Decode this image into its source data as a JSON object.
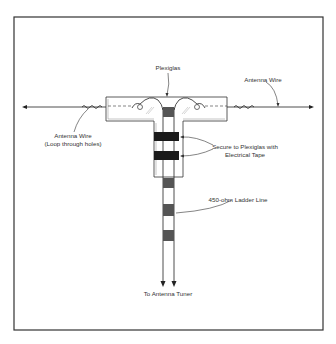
{
  "diagram": {
    "labels": {
      "plexiglas": "Plexiglas",
      "antenna_wire_right": "Antenna Wire",
      "antenna_wire_left_line1": "Antenna Wire",
      "antenna_wire_left_line2": "(Loop through holes)",
      "tape_line1": "Secure to Plexiglas with",
      "tape_line2": "Electrical Tape",
      "ladder_line": "450-ohm Ladder Line",
      "to_tuner": "To Antenna Tuner"
    },
    "colors": {
      "frame": "#333333",
      "line": "#222222",
      "tape": "#1a1a1a",
      "ladder_spacer": "#555555",
      "plexiglas_fill": "#ffffff",
      "text": "#333333"
    }
  }
}
